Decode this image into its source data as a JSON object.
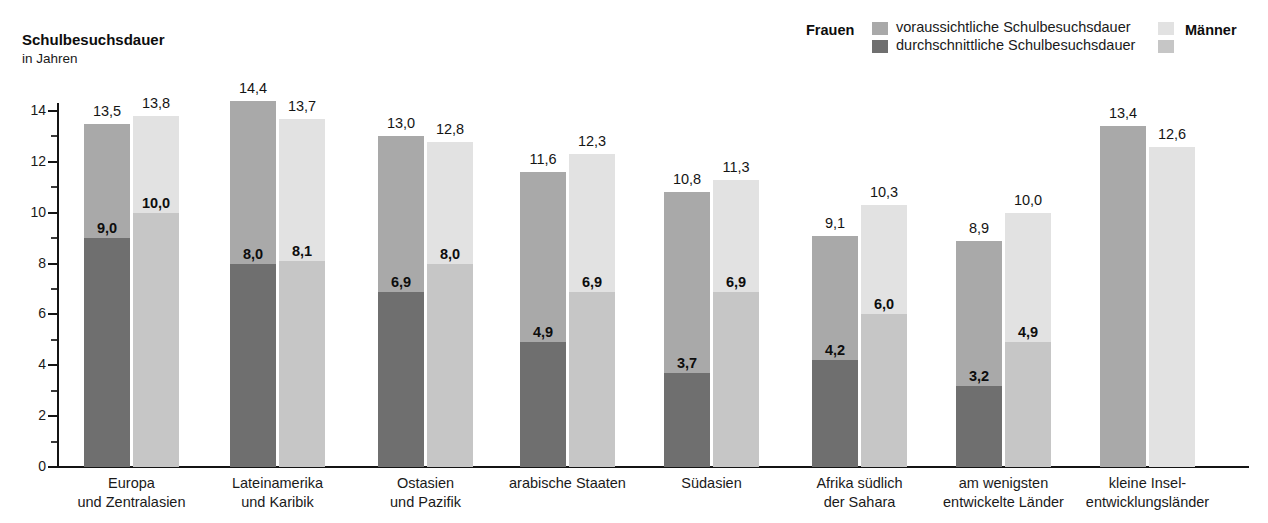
{
  "title": "Schulbesuchsdauer",
  "subtitle": "in Jahren",
  "legend": {
    "women_label": "Frauen",
    "men_label": "Männer",
    "series_expected": "voraussichtliche Schulbesuchsdauer",
    "series_average": "durchschnittliche Schulbesuchsdauer",
    "colors": {
      "women_expected": "#a9a9a9",
      "women_average": "#6f6f6f",
      "men_expected": "#e2e2e2",
      "men_average": "#c6c6c6"
    }
  },
  "axis": {
    "y_ticks": [
      "0",
      "2",
      "4",
      "6",
      "8",
      "10",
      "12",
      "14"
    ],
    "y_min": 0,
    "y_max": 14,
    "y_major_step": 2,
    "y_minor_step": 1
  },
  "categories": [
    {
      "line1": "Europa",
      "line2": "und Zentralasien"
    },
    {
      "line1": "Lateinamerika",
      "line2": "und Karibik"
    },
    {
      "line1": "Ostasien",
      "line2": "und Pazifik"
    },
    {
      "line1": "arabische Staaten",
      "line2": ""
    },
    {
      "line1": "Südasien",
      "line2": ""
    },
    {
      "line1": "Afrika südlich",
      "line2": "der Sahara"
    },
    {
      "line1": "am wenigsten",
      "line2": "entwickelte Länder"
    },
    {
      "line1": "kleine Insel-",
      "line2": "entwicklungsländer"
    }
  ],
  "chart_data": {
    "type": "bar",
    "title": "Schulbesuchsdauer",
    "subtitle": "in Jahren",
    "ylabel": "in Jahren",
    "xlabel": "",
    "ylim": [
      0,
      14
    ],
    "grid": false,
    "legend_position": "top-right",
    "stacked": true,
    "categories": [
      "Europa und Zentralasien",
      "Lateinamerika und Karibik",
      "Ostasien und Pazifik",
      "arabische Staaten",
      "Südasien",
      "Afrika südlich der Sahara",
      "am wenigsten entwickelte Länder",
      "kleine Inselentwicklungsländer"
    ],
    "series": [
      {
        "name": "Frauen – voraussichtliche Schulbesuchsdauer",
        "values": [
          13.5,
          14.4,
          13.0,
          11.6,
          10.8,
          9.1,
          8.9,
          13.4
        ],
        "labels": [
          "13,5",
          "14,4",
          "13,0",
          "11,6",
          "10,8",
          "9,1",
          "8,9",
          "13,4"
        ]
      },
      {
        "name": "Frauen – durchschnittliche Schulbesuchsdauer",
        "values": [
          9.0,
          8.0,
          6.9,
          4.9,
          3.7,
          4.2,
          3.2,
          null
        ],
        "labels": [
          "9,0",
          "8,0",
          "6,9",
          "4,9",
          "3,7",
          "4,2",
          "3,2",
          ""
        ]
      },
      {
        "name": "Männer – voraussichtliche Schulbesuchsdauer",
        "values": [
          13.8,
          13.7,
          12.8,
          12.3,
          11.3,
          10.3,
          10.0,
          12.6
        ],
        "labels": [
          "13,8",
          "13,7",
          "12,8",
          "12,3",
          "11,3",
          "10,3",
          "10,0",
          "12,6"
        ]
      },
      {
        "name": "Männer – durchschnittliche Schulbesuchsdauer",
        "values": [
          10.0,
          8.1,
          8.0,
          6.9,
          6.9,
          6.0,
          4.9,
          null
        ],
        "labels": [
          "10,0",
          "8,1",
          "8,0",
          "6,9",
          "6,9",
          "6,0",
          "4,9",
          ""
        ]
      }
    ]
  },
  "bars": [
    {
      "group": 0,
      "gender": "women",
      "total": 13.5,
      "avg": 9.0,
      "total_label": "13,5",
      "avg_label": "9,0"
    },
    {
      "group": 0,
      "gender": "men",
      "total": 13.8,
      "avg": 10.0,
      "total_label": "13,8",
      "avg_label": "10,0"
    },
    {
      "group": 1,
      "gender": "women",
      "total": 14.4,
      "avg": 8.0,
      "total_label": "14,4",
      "avg_label": "8,0"
    },
    {
      "group": 1,
      "gender": "men",
      "total": 13.7,
      "avg": 8.1,
      "total_label": "13,7",
      "avg_label": "8,1"
    },
    {
      "group": 2,
      "gender": "women",
      "total": 13.0,
      "avg": 6.9,
      "total_label": "13,0",
      "avg_label": "6,9"
    },
    {
      "group": 2,
      "gender": "men",
      "total": 12.8,
      "avg": 8.0,
      "total_label": "12,8",
      "avg_label": "8,0"
    },
    {
      "group": 3,
      "gender": "women",
      "total": 11.6,
      "avg": 4.9,
      "total_label": "11,6",
      "avg_label": "4,9"
    },
    {
      "group": 3,
      "gender": "men",
      "total": 12.3,
      "avg": 6.9,
      "total_label": "12,3",
      "avg_label": "6,9"
    },
    {
      "group": 4,
      "gender": "women",
      "total": 10.8,
      "avg": 3.7,
      "total_label": "10,8",
      "avg_label": "3,7"
    },
    {
      "group": 4,
      "gender": "men",
      "total": 11.3,
      "avg": 6.9,
      "total_label": "11,3",
      "avg_label": "6,9"
    },
    {
      "group": 5,
      "gender": "women",
      "total": 9.1,
      "avg": 4.2,
      "total_label": "9,1",
      "avg_label": "4,2"
    },
    {
      "group": 5,
      "gender": "men",
      "total": 10.3,
      "avg": 6.0,
      "total_label": "10,3",
      "avg_label": "6,0"
    },
    {
      "group": 6,
      "gender": "women",
      "total": 8.9,
      "avg": 3.2,
      "total_label": "8,9",
      "avg_label": "3,2"
    },
    {
      "group": 6,
      "gender": "men",
      "total": 10.0,
      "avg": 4.9,
      "total_label": "10,0",
      "avg_label": "4,9"
    },
    {
      "group": 7,
      "gender": "women",
      "total": 13.4,
      "avg": null,
      "total_label": "13,4",
      "avg_label": ""
    },
    {
      "group": 7,
      "gender": "men",
      "total": 12.6,
      "avg": null,
      "total_label": "12,6",
      "avg_label": ""
    }
  ]
}
